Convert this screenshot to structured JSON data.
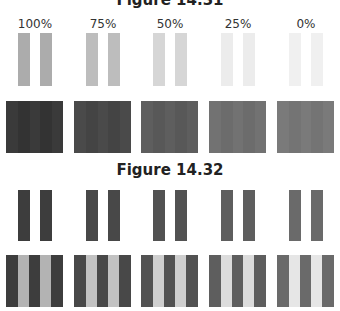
{
  "figure1": {
    "title": "Figure 14.31",
    "columns": [
      {
        "label": "100%",
        "bar_color": "#acacac",
        "block_color": "#3a3a3a",
        "block_stripe_color": "#333333"
      },
      {
        "label": "75%",
        "bar_color": "#bdbdbd",
        "block_color": "#4a4a4a",
        "block_stripe_color": "#444444"
      },
      {
        "label": "50%",
        "bar_color": "#d6d6d6",
        "block_color": "#5e5e5e",
        "block_stripe_color": "#585858"
      },
      {
        "label": "25%",
        "bar_color": "#ececec",
        "block_color": "#727272",
        "block_stripe_color": "#6c6c6c"
      },
      {
        "label": "0%",
        "bar_color": "#f0f0f0",
        "block_color": "#7a7a7a",
        "block_stripe_color": "#747474"
      }
    ]
  },
  "figure2": {
    "title": "Figure 14.32",
    "columns": [
      {
        "bar_color": "#3d3d3d",
        "dark_stripe": "#3d3d3d",
        "light_stripe": "#b3b3b3"
      },
      {
        "bar_color": "#484848",
        "dark_stripe": "#484848",
        "light_stripe": "#c2c2c2"
      },
      {
        "bar_color": "#525252",
        "dark_stripe": "#525252",
        "light_stripe": "#cfcfcf"
      },
      {
        "bar_color": "#5e5e5e",
        "dark_stripe": "#5e5e5e",
        "light_stripe": "#dcdcdc"
      },
      {
        "bar_color": "#6a6a6a",
        "dark_stripe": "#6a6a6a",
        "light_stripe": "#e6e6e6"
      }
    ]
  }
}
